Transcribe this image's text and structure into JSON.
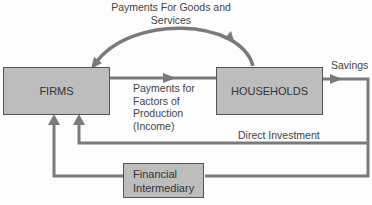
{
  "diagram": {
    "nodes": {
      "firms": "FIRMS",
      "households": "HOUSEHOLDS",
      "financial_intermediary": [
        "Financial",
        "Intermediary"
      ]
    },
    "labels": {
      "goods_services": [
        "Payments For Goods and",
        "Services"
      ],
      "factors": [
        "Payments for",
        "Factors of",
        "Production",
        "(Income)"
      ],
      "savings": "Savings",
      "direct_investment": "Direct Investment"
    },
    "edges": [
      {
        "from": "households",
        "to": "firms",
        "label": "Payments For Goods and Services"
      },
      {
        "from": "firms",
        "to": "households",
        "label": "Payments for Factors of Production (Income)"
      },
      {
        "from": "households",
        "to": "savings",
        "label": "Savings"
      },
      {
        "from": "savings",
        "to": "firms",
        "label": "Direct Investment"
      },
      {
        "from": "savings",
        "to": "financial_intermediary"
      },
      {
        "from": "financial_intermediary",
        "to": "firms"
      }
    ],
    "colors": {
      "box_fill": "#bdbdbd",
      "arrow": "#7a7a7a",
      "border": "#555555"
    }
  }
}
